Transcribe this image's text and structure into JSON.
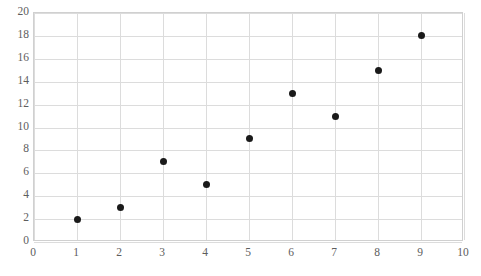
{
  "chart_data": {
    "type": "scatter",
    "title": "",
    "subtitle": "",
    "xlabel": "",
    "ylabel": "",
    "xlim": [
      0,
      10
    ],
    "ylim": [
      0,
      20
    ],
    "xticks": [
      "0",
      "1",
      "2",
      "3",
      "4",
      "5",
      "6",
      "7",
      "8",
      "9",
      "10"
    ],
    "xtick_values": [
      0,
      1,
      2,
      3,
      4,
      5,
      6,
      7,
      8,
      9,
      10
    ],
    "yticks": [
      "0",
      "2",
      "4",
      "6",
      "8",
      "10",
      "12",
      "14",
      "16",
      "18",
      "20"
    ],
    "ytick_values": [
      0,
      2,
      4,
      6,
      8,
      10,
      12,
      14,
      16,
      18,
      20
    ],
    "grid": true,
    "legend": false,
    "legend_position": "none",
    "series": [
      {
        "name": "",
        "marker": "circle",
        "color": "#1a1a1a",
        "points": [
          {
            "x": 1,
            "y": 2
          },
          {
            "x": 2,
            "y": 3
          },
          {
            "x": 3,
            "y": 7
          },
          {
            "x": 4,
            "y": 5
          },
          {
            "x": 5,
            "y": 9
          },
          {
            "x": 6,
            "y": 13
          },
          {
            "x": 7,
            "y": 11
          },
          {
            "x": 8,
            "y": 15
          },
          {
            "x": 9,
            "y": 18
          }
        ]
      }
    ]
  },
  "style": {
    "background": "#ffffff",
    "gridline_color": "#dcdcdc",
    "axis_border_color": "#d0d0d0",
    "tick_label_color": "#5d5d5d",
    "marker_color": "#1a1a1a"
  }
}
